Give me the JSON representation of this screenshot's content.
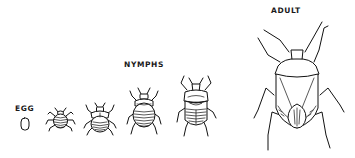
{
  "diagram": {
    "stages": [
      {
        "id": "egg",
        "label": "EGG"
      },
      {
        "id": "nymph-1"
      },
      {
        "id": "nymph-2"
      },
      {
        "id": "nymph-3"
      },
      {
        "id": "nymph-4"
      },
      {
        "id": "adult",
        "label": "ADULT"
      }
    ],
    "group_labels": {
      "nymphs": "NYMPHS"
    },
    "colors": {
      "ink": "#111111",
      "background": "#ffffff"
    }
  }
}
